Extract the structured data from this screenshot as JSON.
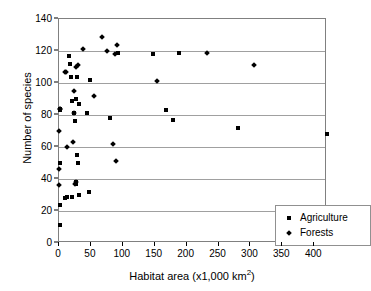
{
  "chart_data": {
    "type": "scatter",
    "title": "",
    "xlabel": "Habitat area (x1,000 km2)",
    "xlabel_base": "Habitat area (x1,000 km",
    "xlabel_sup": "2",
    "xlabel_tail": ")",
    "ylabel": "Number of species",
    "xlim": [
      0,
      420
    ],
    "ylim": [
      0,
      140
    ],
    "xticks": [
      0,
      50,
      100,
      150,
      200,
      250,
      300,
      350,
      400
    ],
    "yticks": [
      0,
      20,
      40,
      60,
      80,
      100,
      120,
      140
    ],
    "grid": "horizontal",
    "legend_position": "bottom-right",
    "marker_color": "#000000",
    "series": [
      {
        "name": "Agriculture",
        "marker": "square",
        "points": [
          [
            1,
            11
          ],
          [
            1,
            24
          ],
          [
            9,
            28
          ],
          [
            13,
            29
          ],
          [
            21,
            29
          ],
          [
            26,
            38
          ],
          [
            27,
            37
          ],
          [
            32,
            30
          ],
          [
            47,
            32
          ],
          [
            29,
            50
          ],
          [
            28,
            55
          ],
          [
            1,
            50
          ],
          [
            1,
            84
          ],
          [
            2,
            83
          ],
          [
            25,
            76
          ],
          [
            24,
            81
          ],
          [
            26,
            90
          ],
          [
            20,
            89
          ],
          [
            32,
            87
          ],
          [
            44,
            81
          ],
          [
            80,
            78
          ],
          [
            49,
            102
          ],
          [
            19,
            104
          ],
          [
            28,
            104
          ],
          [
            18,
            112
          ],
          [
            15,
            117
          ],
          [
            93,
            119
          ],
          [
            148,
            118
          ],
          [
            188,
            119
          ],
          [
            168,
            83
          ],
          [
            178,
            77
          ],
          [
            281,
            72
          ],
          [
            420,
            68
          ]
        ]
      },
      {
        "name": "Forests",
        "marker": "diamond",
        "points": [
          [
            0,
            36
          ],
          [
            0,
            46
          ],
          [
            0,
            70
          ],
          [
            1,
            84
          ],
          [
            2,
            84
          ],
          [
            12,
            60
          ],
          [
            22,
            63
          ],
          [
            23,
            95
          ],
          [
            24,
            81
          ],
          [
            25,
            37
          ],
          [
            26,
            38
          ],
          [
            27,
            110
          ],
          [
            29,
            111
          ],
          [
            38,
            121
          ],
          [
            10,
            107
          ],
          [
            11,
            107
          ],
          [
            55,
            92
          ],
          [
            68,
            129
          ],
          [
            75,
            120
          ],
          [
            88,
            118
          ],
          [
            91,
            124
          ],
          [
            84,
            62
          ],
          [
            90,
            51
          ],
          [
            154,
            101
          ],
          [
            232,
            119
          ],
          [
            305,
            111
          ]
        ]
      }
    ]
  },
  "legend": {
    "items": [
      {
        "label": "Agriculture",
        "marker": "square"
      },
      {
        "label": "Forests",
        "marker": "diamond"
      }
    ]
  }
}
